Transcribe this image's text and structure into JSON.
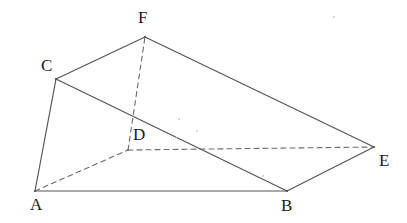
{
  "figure": {
    "type": "3d-solid-line-diagram",
    "canvas": {
      "width": 407,
      "height": 223,
      "background": "#ffffff"
    },
    "stroke": {
      "solid_color": "#555555",
      "dashed_color": "#6b6b6b",
      "solid_width": 1.2,
      "dashed_width": 1.1,
      "dash_pattern": "5,4"
    },
    "label_color": "#1b1b1b",
    "label_font_size": 17,
    "vertices": [
      {
        "name": "A",
        "label": "A",
        "x": 35,
        "y": 191,
        "label_x": 30,
        "label_y": 196,
        "hidden": false
      },
      {
        "name": "B",
        "label": "B",
        "x": 287,
        "y": 191,
        "label_x": 281,
        "label_y": 197,
        "hidden": false
      },
      {
        "name": "C",
        "label": "C",
        "x": 56,
        "y": 79,
        "label_x": 41,
        "label_y": 57,
        "hidden": false
      },
      {
        "name": "D",
        "label": "D",
        "x": 128,
        "y": 150,
        "label_x": 133,
        "label_y": 126,
        "hidden": true
      },
      {
        "name": "E",
        "label": "E",
        "x": 374,
        "y": 147,
        "label_x": 379,
        "label_y": 152,
        "hidden": false
      },
      {
        "name": "F",
        "label": "F",
        "x": 145,
        "y": 37,
        "label_x": 138,
        "label_y": 9,
        "hidden": false
      }
    ],
    "edges": [
      {
        "name": "edge-AB",
        "from": "A",
        "to": "B",
        "style": "solid",
        "hidden": false
      },
      {
        "name": "edge-AC",
        "from": "A",
        "to": "C",
        "style": "solid",
        "hidden": false
      },
      {
        "name": "edge-CF",
        "from": "C",
        "to": "F",
        "style": "solid",
        "hidden": false
      },
      {
        "name": "edge-CB",
        "from": "C",
        "to": "B",
        "style": "solid",
        "hidden": false
      },
      {
        "name": "edge-BE",
        "from": "B",
        "to": "E",
        "style": "solid",
        "hidden": false
      },
      {
        "name": "edge-FE",
        "from": "F",
        "to": "E",
        "style": "solid",
        "hidden": false
      },
      {
        "name": "edge-AD",
        "from": "A",
        "to": "D",
        "style": "dashed",
        "hidden": true
      },
      {
        "name": "edge-DE",
        "from": "D",
        "to": "E",
        "style": "dashed",
        "hidden": true
      },
      {
        "name": "edge-DF",
        "from": "D",
        "to": "F",
        "style": "dashed",
        "hidden": true
      }
    ],
    "specks": [
      {
        "x": 178,
        "y": 118,
        "size": 2
      },
      {
        "x": 196,
        "y": 130,
        "size": 2
      },
      {
        "x": 262,
        "y": 175,
        "size": 2
      },
      {
        "x": 333,
        "y": 16,
        "size": 2
      },
      {
        "x": 176,
        "y": 137,
        "size": 1
      }
    ]
  }
}
